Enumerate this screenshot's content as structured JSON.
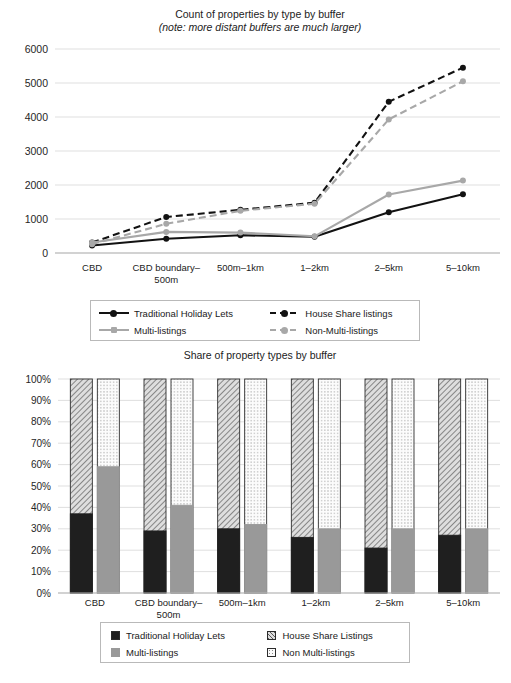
{
  "figure1": {
    "title": "Count of properties by type by buffer",
    "subtitle": "(note: more distant buffers are much larger)",
    "legend": [
      {
        "label": "Traditional Holiday Lets",
        "key": "k-solid-dark"
      },
      {
        "label": "House Share listings",
        "key": "k-dash-dark"
      },
      {
        "label": "Multi-listings",
        "key": "k-solid-gray"
      },
      {
        "label": "Non-Multi-listings",
        "key": "k-dash-gray"
      }
    ]
  },
  "figure2": {
    "title": "Share of property types by buffer",
    "legend": [
      {
        "label": "Traditional Holiday Lets",
        "key": "sw-trad"
      },
      {
        "label": "House Share Listings",
        "key": "sw-hs"
      },
      {
        "label": "Multi-listings",
        "key": "sw-multi"
      },
      {
        "label": "Non Multi-listings",
        "key": "sw-nonmulti"
      }
    ]
  },
  "chart_data": [
    {
      "type": "line",
      "title": "Count of properties by type by buffer",
      "subtitle": "(note: more distant buffers are much larger)",
      "xlabel": "",
      "ylabel": "",
      "categories": [
        "CBD",
        "CBD boundary–500m",
        "500m–1km",
        "1–2km",
        "2–5km",
        "5–10km"
      ],
      "ylim": [
        0,
        6000
      ],
      "yticks": [
        0,
        1000,
        2000,
        3000,
        4000,
        5000,
        6000
      ],
      "grid": true,
      "legend_position": "bottom",
      "series": [
        {
          "name": "Traditional Holiday Lets",
          "style": "solid",
          "color": "#121212",
          "values": [
            220,
            420,
            520,
            480,
            1200,
            1730
          ]
        },
        {
          "name": "House Share listings",
          "style": "dashed",
          "color": "#121212",
          "values": [
            310,
            1060,
            1270,
            1480,
            4450,
            5450
          ]
        },
        {
          "name": "Multi-listings",
          "style": "solid",
          "color": "#a8a8a8",
          "values": [
            310,
            620,
            600,
            490,
            1720,
            2130
          ]
        },
        {
          "name": "Non-Multi-listings",
          "style": "dashed",
          "color": "#a8a8a8",
          "values": [
            260,
            860,
            1240,
            1450,
            3930,
            5050
          ]
        }
      ]
    },
    {
      "type": "bar",
      "subtype": "stacked-100-percent-grouped",
      "title": "Share of property types by buffer",
      "xlabel": "",
      "ylabel": "",
      "categories": [
        "CBD",
        "CBD boundary–500m",
        "500m–1km",
        "1–2km",
        "2–5km",
        "5–10km"
      ],
      "ylim": [
        0,
        100
      ],
      "yticks": [
        0,
        10,
        20,
        30,
        40,
        50,
        60,
        70,
        80,
        90,
        100
      ],
      "ytick_labels": [
        "0%",
        "10%",
        "20%",
        "30%",
        "40%",
        "50%",
        "60%",
        "70%",
        "80%",
        "90%",
        "100%"
      ],
      "grid": true,
      "legend_position": "bottom",
      "bar_groups": [
        {
          "name": "Let type split",
          "stacks": [
            {
              "name": "Traditional Holiday Lets",
              "color": "#1f1f1f",
              "values": [
                37,
                29,
                30,
                26,
                21,
                27
              ]
            },
            {
              "name": "House Share Listings",
              "color": "#dcdcdc",
              "pattern": "diagonal-hatch",
              "values": [
                63,
                71,
                70,
                74,
                79,
                73
              ]
            }
          ]
        },
        {
          "name": "Multi-listing split",
          "stacks": [
            {
              "name": "Multi-listings",
              "color": "#999999",
              "values": [
                59,
                41,
                32,
                30,
                30,
                30
              ]
            },
            {
              "name": "Non Multi-listings",
              "color": "#fbfbfb",
              "pattern": "dotted",
              "values": [
                41,
                59,
                68,
                70,
                70,
                70
              ]
            }
          ]
        }
      ]
    }
  ]
}
